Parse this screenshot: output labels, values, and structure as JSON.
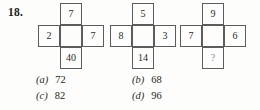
{
  "question": {
    "number": "18."
  },
  "figures": [
    {
      "name": "cross-1",
      "top": "7",
      "left": "2",
      "center": "",
      "right": "7",
      "bottom": "40",
      "bottom_is_unknown": false
    },
    {
      "name": "cross-2",
      "top": "5",
      "left": "8",
      "center": "",
      "right": "3",
      "bottom": "14",
      "bottom_is_unknown": false
    },
    {
      "name": "cross-3",
      "top": "9",
      "left": "7",
      "center": "",
      "right": "6",
      "bottom": "?",
      "bottom_is_unknown": true
    }
  ],
  "options": [
    {
      "letter": "(a)",
      "value": "72"
    },
    {
      "letter": "(b)",
      "value": "68"
    },
    {
      "letter": "(c)",
      "value": "82"
    },
    {
      "letter": "(d)",
      "value": "96"
    }
  ]
}
